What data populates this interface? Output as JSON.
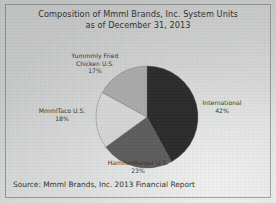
{
  "exhibit": {
    "title_line_1": "Composition of Mmml Brands, Inc. System Units",
    "title_line_2": "as of December 31, 2013",
    "source": "Source: Mmml Brands, Inc. 2013 Financial Report"
  },
  "chart_data": {
    "type": "pie",
    "title": "Composition of Mmml Brands, Inc. System Units as of December 31, 2013",
    "xlabel": "",
    "ylabel": "",
    "legend": "none",
    "grid": false,
    "units": "percent of system units",
    "start_angle_deg": 0,
    "direction": "clockwise",
    "categories": [
      "International",
      "Hammmburger U.S.",
      "MmmlTaco U.S.",
      "Yummmly Fried Chicken U.S."
    ],
    "values": [
      42,
      23,
      18,
      17
    ],
    "slices": [
      {
        "label": "International",
        "label_line_1": "International",
        "value": 42,
        "value_label": "42%",
        "color": "#2b2b2b",
        "start_deg": 0,
        "end_deg": 151.2
      },
      {
        "label": "Hammmburger U.S.",
        "label_line_1": "Hammmburger U.S.",
        "value": 23,
        "value_label": "23%",
        "color": "#5c5c5c",
        "start_deg": 151.2,
        "end_deg": 234.0
      },
      {
        "label": "MmmlTaco U.S.",
        "label_line_1": "MmmlTaco U.S.",
        "value": 18,
        "value_label": "18%",
        "color": "#d4d4d4",
        "start_deg": 234.0,
        "end_deg": 298.8
      },
      {
        "label": "Yummmly Fried Chicken U.S.",
        "label_line_1": "Yummmly Fried",
        "label_line_2": "Chicken U.S.",
        "value": 17,
        "value_label": "17%",
        "color": "#a9a9a9",
        "start_deg": 298.8,
        "end_deg": 360.0
      }
    ]
  }
}
